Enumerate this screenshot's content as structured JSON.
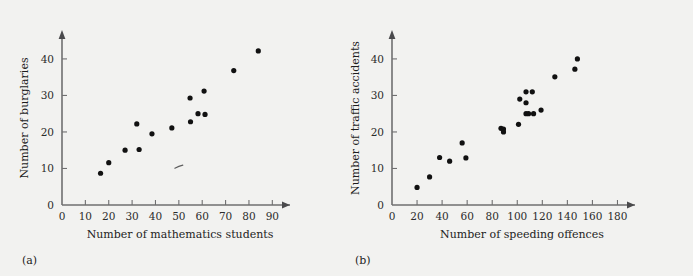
{
  "figure": {
    "background_color": "#f2f2f0",
    "dot_color": "#111111",
    "axis_color": "#6f6f70"
  },
  "chart_data": [
    {
      "type": "scatter",
      "panel_label": "(a)",
      "title": "",
      "xlabel": "Number of mathematics students",
      "ylabel": "Number of burglaries",
      "xlim": [
        0,
        95
      ],
      "ylim": [
        0,
        46
      ],
      "xticks": [
        0,
        10,
        20,
        30,
        40,
        50,
        60,
        70,
        80,
        90
      ],
      "yticks": [
        0,
        10,
        20,
        30,
        40
      ],
      "grid": false,
      "legend": null,
      "points": [
        {
          "x": 16.5,
          "y": 8.7
        },
        {
          "x": 20.0,
          "y": 11.6
        },
        {
          "x": 27.0,
          "y": 15.0
        },
        {
          "x": 32.0,
          "y": 22.2
        },
        {
          "x": 33.0,
          "y": 15.2
        },
        {
          "x": 38.5,
          "y": 19.5
        },
        {
          "x": 47.0,
          "y": 21.1
        },
        {
          "x": 54.8,
          "y": 29.3
        },
        {
          "x": 55.0,
          "y": 22.8
        },
        {
          "x": 58.2,
          "y": 25.0
        },
        {
          "x": 60.8,
          "y": 31.2
        },
        {
          "x": 61.2,
          "y": 24.8
        },
        {
          "x": 73.5,
          "y": 36.8
        },
        {
          "x": 84.0,
          "y": 42.2
        }
      ],
      "annotations": [
        {
          "name": "stray-mark",
          "x": 50.0,
          "y": 10.5
        }
      ]
    },
    {
      "type": "scatter",
      "panel_label": "(b)",
      "title": "",
      "xlabel": "Number of speeding offences",
      "ylabel": "Number of traffic accidents",
      "xlim": [
        0,
        190
      ],
      "ylim": [
        0,
        46
      ],
      "xticks": [
        0,
        20,
        40,
        60,
        80,
        100,
        120,
        140,
        160,
        180
      ],
      "yticks": [
        0,
        10,
        20,
        30,
        40
      ],
      "grid": false,
      "legend": null,
      "points": [
        {
          "x": 20,
          "y": 4.8
        },
        {
          "x": 30,
          "y": 7.7
        },
        {
          "x": 38,
          "y": 13.0
        },
        {
          "x": 46,
          "y": 12.0
        },
        {
          "x": 56,
          "y": 17.0
        },
        {
          "x": 59,
          "y": 12.9
        },
        {
          "x": 87,
          "y": 21.0
        },
        {
          "x": 89,
          "y": 20.8
        },
        {
          "x": 89,
          "y": 20.0
        },
        {
          "x": 101,
          "y": 22.1
        },
        {
          "x": 102,
          "y": 29.0
        },
        {
          "x": 107,
          "y": 28.0
        },
        {
          "x": 107,
          "y": 31.0
        },
        {
          "x": 107,
          "y": 25.0
        },
        {
          "x": 109,
          "y": 25.0
        },
        {
          "x": 112,
          "y": 31.0
        },
        {
          "x": 113,
          "y": 25.0
        },
        {
          "x": 119,
          "y": 26.0
        },
        {
          "x": 130,
          "y": 35.1
        },
        {
          "x": 146,
          "y": 37.2
        },
        {
          "x": 148,
          "y": 40.0
        }
      ],
      "annotations": []
    }
  ]
}
